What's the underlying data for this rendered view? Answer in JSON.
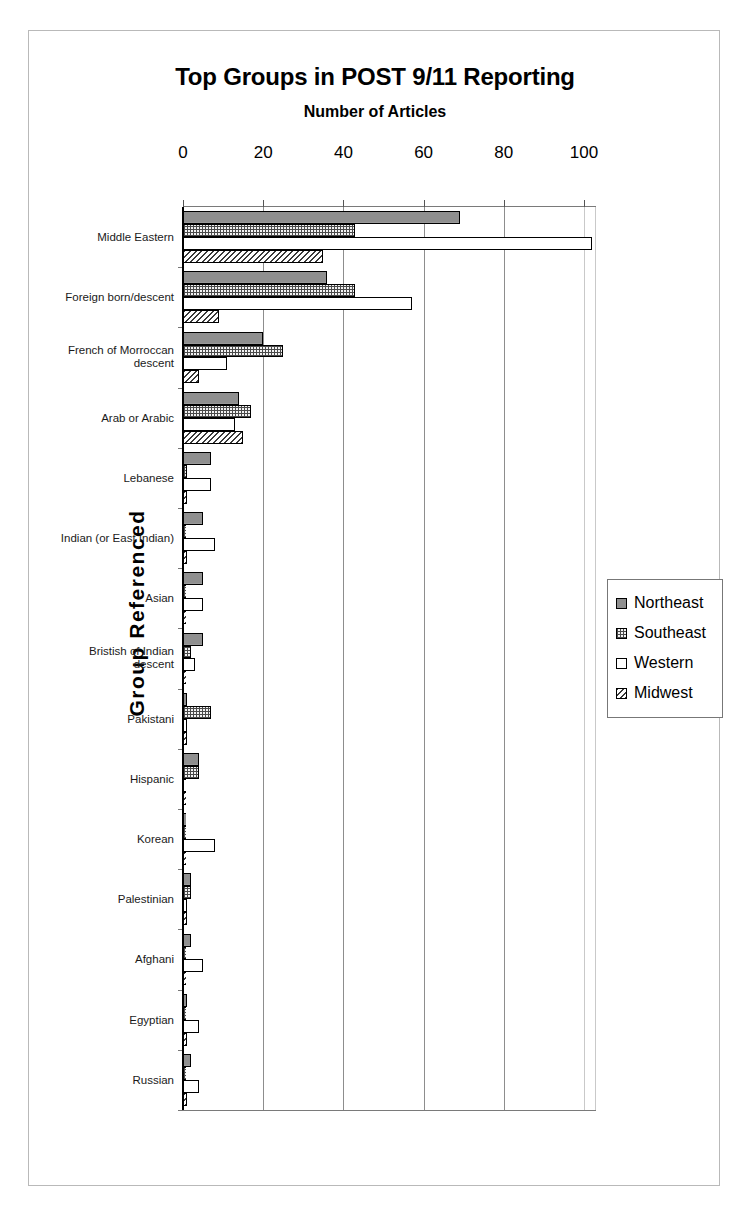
{
  "chart_data": {
    "type": "bar",
    "orientation": "horizontal",
    "title": "Top Groups in POST 9/11 Reporting",
    "subtitle": "Number of Articles",
    "xlabel": "Number of Articles",
    "ylabel": "Group Referenced",
    "xlim": [
      0,
      100
    ],
    "xticks": [
      0,
      20,
      40,
      60,
      80,
      100
    ],
    "xtick_labels": [
      "0",
      "20",
      "40",
      "60",
      "80",
      "100"
    ],
    "grid": true,
    "grid_axis": "x",
    "legend_position": "right",
    "categories": [
      "Middle Eastern",
      "Foreign born/descent",
      "French of Morroccan\ndescent",
      "Arab or Arabic",
      "Lebanese",
      "Indian (or East Indian)",
      "Asian",
      "Bristish of Indian\ndescent",
      "Pakistani",
      "Hispanic",
      "Korean",
      "Palestinian",
      "Afghani",
      "Egyptian",
      "Russian"
    ],
    "series": [
      {
        "name": "Northeast",
        "pattern": "solid-gray",
        "color": "#8f8f8f",
        "values": [
          69,
          36,
          20,
          14,
          7,
          5,
          5,
          5,
          1,
          4,
          0,
          2,
          2,
          1,
          2
        ]
      },
      {
        "name": "Southeast",
        "pattern": "checkered",
        "color": "#f2f2f2",
        "values": [
          43,
          43,
          25,
          17,
          1,
          0,
          0,
          2,
          7,
          4,
          0,
          2,
          0,
          0,
          0
        ]
      },
      {
        "name": "Western",
        "pattern": "empty-white",
        "color": "#ffffff",
        "values": [
          102,
          57,
          11,
          13,
          7,
          8,
          5,
          3,
          1,
          0,
          8,
          1,
          5,
          4,
          4
        ]
      },
      {
        "name": "Midwest",
        "pattern": "diagonal-hatch",
        "color": "#ffffff",
        "values": [
          35,
          9,
          4,
          15,
          1,
          1,
          0,
          0,
          1,
          0,
          0,
          1,
          0,
          1,
          1
        ]
      }
    ]
  },
  "legend": {
    "items": [
      {
        "label": "Northeast",
        "key": "northeast"
      },
      {
        "label": "Southeast",
        "key": "southeast"
      },
      {
        "label": "Western",
        "key": "western"
      },
      {
        "label": "Midwest",
        "key": "midwest"
      }
    ]
  }
}
